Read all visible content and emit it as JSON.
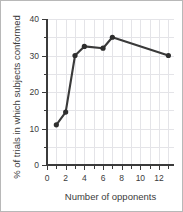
{
  "chart_data": {
    "type": "line",
    "title": "",
    "xlabel": "Number of opponents",
    "ylabel": "% of trials in which subjects conformed",
    "x": [
      1,
      2,
      3,
      4,
      6,
      7,
      13
    ],
    "values": [
      11,
      14.5,
      30,
      32.5,
      32,
      35,
      30
    ],
    "series": [
      {
        "name": "conformity",
        "x": [
          1,
          2,
          3,
          4,
          6,
          7,
          13
        ],
        "values": [
          11,
          14.5,
          30,
          32.5,
          32,
          35,
          30
        ]
      }
    ],
    "xlim": [
      0,
      13.6
    ],
    "ylim": [
      0,
      40
    ],
    "x_ticks_major": [
      0,
      2,
      4,
      6,
      8,
      10,
      12
    ],
    "x_tick_labels": [
      "0",
      "2",
      "4",
      "6",
      "8",
      "10",
      "12"
    ],
    "x_ticks_minor": [
      1,
      3,
      5,
      7,
      9,
      11,
      13
    ],
    "y_ticks_major": [
      0,
      10,
      20,
      30,
      40
    ],
    "y_tick_labels": [
      "0",
      "10",
      "20",
      "30",
      "40"
    ],
    "y_ticks_minor": [
      5,
      15,
      25,
      35
    ],
    "grid": true,
    "legend": "none",
    "colors": {
      "line": "#3a3a3a",
      "marker": "#2e2e2e",
      "grid": "#e4e4e8",
      "axis": "#3b3b3b",
      "frame": "#b8b8b8",
      "background": "#ffffff"
    }
  }
}
